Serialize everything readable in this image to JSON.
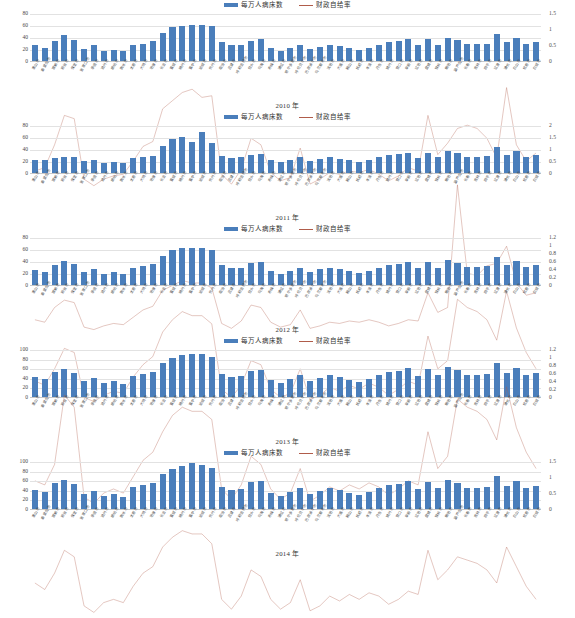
{
  "legend": {
    "bar_label": "每万人病床数",
    "line_label": "财政自给率",
    "bar_color": "#4a7ebb",
    "line_color": "#b05c4a"
  },
  "categories": [
    "唐山市",
    "秦皇岛市",
    "邯郸市",
    "邢台市",
    "保定市",
    "张家口市",
    "承德市",
    "沧州市",
    "廊坊市",
    "衡水市",
    "太原市",
    "大同市",
    "阳泉市",
    "长治市",
    "晋城市",
    "朔州市",
    "晋中市",
    "运城市",
    "忻州市",
    "临汾市",
    "吕梁市",
    "呼和浩特市",
    "包头市",
    "乌海市",
    "赤峰市",
    "通辽市",
    "鄂尔多斯市",
    "呼伦贝尔市",
    "巴彦淖尔市",
    "乌兰察布市",
    "沈阳市",
    "大连市",
    "鞍山市",
    "抚顺市",
    "本溪市",
    "丹东市",
    "锦州市",
    "营口市",
    "阜新市",
    "辽阳市",
    "盘锦市",
    "铁岭市",
    "朝阳市",
    "葫芦岛市",
    "长春市",
    "吉林市",
    "四平市",
    "辽源市",
    "通化市",
    "白山市",
    "松原市",
    "白城市"
  ],
  "chart_data": [
    {
      "type": "bar",
      "title": "2010 年",
      "xlabel": "",
      "ylabel": "",
      "ylim": [
        0,
        80
      ],
      "y2lim": [
        0,
        1.5
      ],
      "yticks": [
        80,
        60,
        40,
        20,
        0
      ],
      "y2ticks": [
        1.5,
        1,
        0.5,
        0
      ],
      "grid": true,
      "legend_position": "top-center",
      "series": [
        {
          "name": "每万人病床数",
          "kind": "bar",
          "axis": "left",
          "values": [
            26,
            22,
            34,
            44,
            35,
            20,
            26,
            17,
            19,
            16,
            26,
            29,
            33,
            47,
            57,
            59,
            60,
            60,
            58,
            31,
            27,
            27,
            34,
            36,
            21,
            17,
            22,
            27,
            20,
            24,
            27,
            25,
            21,
            18,
            21,
            27,
            32,
            33,
            37,
            26,
            36,
            27,
            39,
            35,
            28,
            28,
            29,
            45,
            31,
            38,
            28,
            31
          ]
        },
        {
          "name": "财政自给率",
          "kind": "line",
          "axis": "right",
          "values": [
            0.54,
            0.56,
            0.7,
            0.88,
            0.86,
            0.49,
            0.45,
            0.49,
            0.51,
            0.52,
            0.6,
            0.69,
            0.72,
            0.92,
            0.97,
            1.02,
            1.04,
            0.99,
            1.0,
            0.52,
            0.46,
            0.55,
            0.74,
            0.7,
            0.53,
            0.48,
            0.5,
            0.68,
            0.46,
            0.49,
            0.53,
            0.52,
            0.54,
            0.53,
            0.55,
            0.52,
            0.48,
            0.51,
            0.56,
            0.54,
            0.88,
            0.64,
            0.71,
            0.8,
            0.82,
            0.8,
            0.74,
            0.62,
            1.05,
            0.7,
            0.6,
            0.65
          ]
        }
      ]
    },
    {
      "type": "bar",
      "title": "2011 年",
      "xlabel": "",
      "ylabel": "",
      "ylim": [
        0,
        80
      ],
      "y2lim": [
        0,
        2
      ],
      "yticks": [
        80,
        60,
        40,
        20,
        0
      ],
      "y2ticks": [
        2,
        1.5,
        1,
        0.5,
        0
      ],
      "grid": true,
      "legend_position": "top-center",
      "series": [
        {
          "name": "每万人病床数",
          "kind": "bar",
          "axis": "left",
          "values": [
            22,
            21,
            25,
            27,
            26,
            20,
            22,
            17,
            18,
            16,
            25,
            27,
            28,
            45,
            57,
            60,
            52,
            68,
            50,
            28,
            25,
            26,
            30,
            32,
            21,
            18,
            22,
            26,
            20,
            23,
            26,
            24,
            21,
            19,
            22,
            26,
            30,
            31,
            34,
            25,
            33,
            26,
            36,
            33,
            27,
            27,
            28,
            44,
            30,
            36,
            27,
            30
          ]
        },
        {
          "name": "财政自给率",
          "kind": "line",
          "axis": "right",
          "values": [
            0.42,
            0.4,
            0.52,
            0.58,
            0.56,
            0.36,
            0.34,
            0.37,
            0.39,
            0.38,
            0.44,
            0.5,
            0.53,
            0.66,
            0.7,
            0.74,
            0.72,
            0.72,
            0.68,
            0.39,
            0.35,
            0.41,
            0.54,
            0.52,
            0.4,
            0.36,
            0.38,
            0.5,
            0.35,
            0.37,
            0.4,
            0.39,
            0.41,
            0.4,
            0.42,
            0.4,
            0.37,
            0.39,
            0.42,
            0.41,
            0.64,
            0.48,
            0.52,
            1.52,
            0.8,
            0.78,
            0.86,
            0.88,
            1.02,
            0.72,
            0.62,
            0.64
          ]
        }
      ]
    },
    {
      "type": "bar",
      "title": "2012 年",
      "xlabel": "",
      "ylabel": "",
      "ylim": [
        0,
        80
      ],
      "y2lim": [
        0,
        1.2
      ],
      "yticks": [
        80,
        60,
        40,
        20,
        0
      ],
      "y2ticks": [
        1.2,
        1,
        0.8,
        0.6,
        0.4,
        0.2,
        0
      ],
      "grid": true,
      "legend_position": "top-center",
      "series": [
        {
          "name": "每万人病床数",
          "kind": "bar",
          "axis": "left",
          "values": [
            25,
            22,
            34,
            40,
            35,
            22,
            26,
            19,
            21,
            18,
            28,
            31,
            35,
            49,
            58,
            62,
            62,
            62,
            58,
            34,
            29,
            29,
            36,
            38,
            23,
            19,
            24,
            29,
            22,
            26,
            29,
            27,
            23,
            20,
            24,
            29,
            34,
            35,
            39,
            28,
            38,
            29,
            41,
            37,
            30,
            30,
            31,
            47,
            33,
            40,
            30,
            33
          ]
        },
        {
          "name": "财政自给率",
          "kind": "line",
          "axis": "right",
          "values": [
            0.5,
            0.48,
            0.56,
            0.66,
            0.64,
            0.42,
            0.4,
            0.43,
            0.45,
            0.44,
            0.52,
            0.58,
            0.62,
            0.74,
            0.8,
            0.84,
            0.82,
            0.82,
            0.78,
            0.46,
            0.42,
            0.48,
            0.6,
            0.58,
            0.46,
            0.42,
            0.44,
            0.56,
            0.41,
            0.43,
            0.47,
            0.45,
            0.48,
            0.46,
            0.49,
            0.47,
            0.43,
            0.46,
            0.5,
            0.48,
            0.72,
            0.56,
            0.6,
            0.9,
            0.86,
            0.84,
            0.8,
            0.7,
            0.94,
            0.76,
            0.64,
            0.56
          ]
        }
      ]
    },
    {
      "type": "bar",
      "title": "2013 年",
      "xlabel": "",
      "ylabel": "",
      "ylim": [
        0,
        100
      ],
      "y2lim": [
        0,
        1.2
      ],
      "yticks": [
        100,
        80,
        60,
        40,
        20,
        0
      ],
      "y2ticks": [
        1.2,
        1,
        0.8,
        0.6,
        0.4,
        0.2,
        0
      ],
      "grid": true,
      "legend_position": "top-center",
      "series": [
        {
          "name": "每万人病床数",
          "kind": "bar",
          "axis": "left",
          "values": [
            42,
            38,
            52,
            58,
            50,
            34,
            40,
            30,
            33,
            28,
            44,
            48,
            52,
            70,
            82,
            88,
            90,
            90,
            84,
            48,
            42,
            44,
            54,
            56,
            36,
            30,
            37,
            45,
            34,
            40,
            45,
            42,
            36,
            32,
            38,
            45,
            52,
            54,
            60,
            44,
            58,
            45,
            62,
            57,
            46,
            46,
            48,
            70,
            50,
            60,
            46,
            50
          ]
        },
        {
          "name": "财政自给率",
          "kind": "line",
          "axis": "right",
          "values": [
            0.56,
            0.54,
            0.64,
            0.98,
            0.92,
            0.48,
            0.45,
            0.5,
            0.52,
            0.5,
            0.58,
            0.66,
            0.7,
            0.8,
            0.88,
            0.92,
            0.9,
            0.9,
            0.86,
            0.52,
            0.47,
            0.54,
            0.68,
            0.64,
            0.52,
            0.47,
            0.5,
            0.62,
            0.46,
            0.49,
            0.53,
            0.51,
            0.54,
            0.52,
            0.55,
            0.53,
            0.49,
            0.52,
            0.56,
            0.54,
            0.8,
            0.62,
            0.68,
            0.96,
            0.92,
            0.9,
            0.86,
            0.76,
            1.02,
            0.82,
            0.7,
            0.62
          ]
        }
      ]
    },
    {
      "type": "bar",
      "title": "2014 年",
      "xlabel": "",
      "ylabel": "",
      "ylim": [
        0,
        100
      ],
      "y2lim": [
        0,
        1.5
      ],
      "yticks": [
        100,
        80,
        60,
        40,
        20,
        0
      ],
      "y2ticks": [
        1.5,
        1,
        0.5,
        0
      ],
      "grid": true,
      "legend_position": "top-center",
      "series": [
        {
          "name": "每万人病床数",
          "kind": "bar",
          "axis": "left",
          "values": [
            40,
            36,
            54,
            60,
            52,
            32,
            38,
            28,
            31,
            26,
            46,
            50,
            54,
            72,
            84,
            90,
            96,
            92,
            86,
            46,
            40,
            42,
            56,
            58,
            34,
            28,
            35,
            43,
            32,
            38,
            43,
            40,
            34,
            30,
            36,
            43,
            50,
            52,
            58,
            42,
            56,
            43,
            60,
            55,
            44,
            44,
            46,
            68,
            48,
            58,
            44,
            48
          ]
        },
        {
          "name": "财政自给率",
          "kind": "line",
          "axis": "right",
          "values": [
            0.76,
            0.72,
            0.82,
            0.96,
            0.92,
            0.62,
            0.58,
            0.64,
            0.66,
            0.64,
            0.74,
            0.82,
            0.86,
            0.98,
            1.04,
            1.08,
            1.06,
            1.06,
            1.0,
            0.66,
            0.6,
            0.68,
            0.84,
            0.8,
            0.66,
            0.6,
            0.64,
            0.78,
            0.59,
            0.62,
            0.68,
            0.65,
            0.69,
            0.66,
            0.7,
            0.68,
            0.63,
            0.66,
            0.71,
            0.69,
            0.96,
            0.78,
            0.84,
            0.92,
            0.9,
            0.88,
            0.84,
            0.76,
            0.98,
            0.86,
            0.74,
            0.66
          ]
        }
      ]
    }
  ]
}
